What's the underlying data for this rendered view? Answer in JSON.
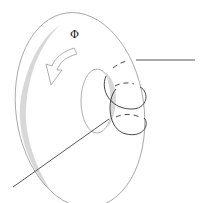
{
  "diagram": {
    "flux_label": "Φ",
    "colors": {
      "outline": "#9a9a9a",
      "coil": "#333333",
      "leads": "#444444",
      "shade": "#d8d8d8",
      "background": "#ffffff"
    }
  }
}
